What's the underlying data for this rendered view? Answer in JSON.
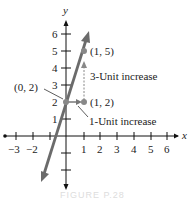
{
  "figure": {
    "axes": {
      "x_label": "x",
      "y_label": "y",
      "x_ticks": [
        "−3",
        "−2",
        "1",
        "2",
        "3",
        "4",
        "5",
        "6"
      ],
      "y_ticks": [
        "1",
        "2",
        "3",
        "4",
        "5",
        "6"
      ]
    },
    "points": [
      {
        "label": "(0, 2)",
        "x": 0,
        "y": 2
      },
      {
        "label": "(1, 2)",
        "x": 1,
        "y": 2
      },
      {
        "label": "(1, 5)",
        "x": 1,
        "y": 5
      }
    ],
    "annotations": {
      "rise": "3-Unit increase",
      "run": "1-Unit increase"
    },
    "line": {
      "equation": "y = 3x + 2",
      "slope": 3,
      "intercept": 2
    },
    "caption": "FIGURE P.28",
    "colors": {
      "line": "#6b6b6b",
      "axis": "#111111",
      "point": "#888888"
    }
  }
}
